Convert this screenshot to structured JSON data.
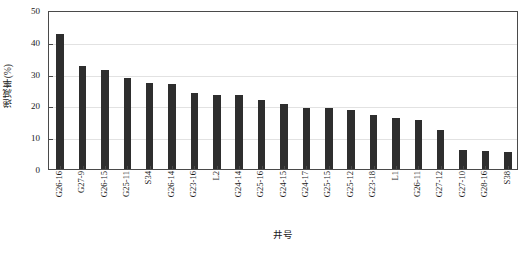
{
  "chart_data": {
    "type": "bar",
    "title": "",
    "xlabel": "井号",
    "ylabel": "递减率(%)",
    "ylim": [
      0,
      50
    ],
    "yticks": [
      0,
      10,
      20,
      30,
      40,
      50
    ],
    "ytick_labels": [
      "0",
      "10",
      "20",
      "30",
      "40",
      "50"
    ],
    "grid": true,
    "legend": "none",
    "bar_color": "#2e2e2e",
    "categories": [
      "G26-16",
      "G27-9",
      "G26-15",
      "G25-11",
      "S34",
      "G26-14",
      "G23-16",
      "L2",
      "G24-14",
      "G25-16",
      "G24-15",
      "G24-17",
      "G25-15",
      "G25-12",
      "G23-18",
      "L1",
      "G26-11",
      "G27-12",
      "G27-10",
      "G28-16",
      "S38"
    ],
    "values": [
      42.5,
      32.5,
      31.0,
      28.7,
      27.0,
      26.7,
      24.0,
      23.3,
      23.2,
      21.8,
      20.5,
      19.3,
      19.2,
      18.6,
      17.0,
      16.0,
      15.5,
      12.3,
      6.0,
      5.8,
      5.3
    ],
    "series": [
      {
        "name": "递减率",
        "values": [
          42.5,
          32.5,
          31.0,
          28.7,
          27.0,
          26.7,
          24.0,
          23.3,
          23.2,
          21.8,
          20.5,
          19.3,
          19.2,
          18.6,
          17.0,
          16.0,
          15.5,
          12.3,
          6.0,
          5.8,
          5.3
        ]
      }
    ]
  }
}
